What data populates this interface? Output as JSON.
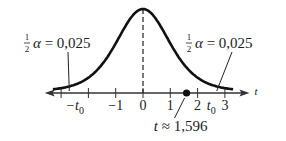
{
  "chart_data": {
    "type": "line",
    "title": "",
    "xlabel": "t",
    "ylabel": "",
    "xlim": [
      -3.6,
      3.9
    ],
    "x_ticks": [
      -3,
      -2,
      -1,
      0,
      1,
      2,
      3
    ],
    "tick_labels": [
      {
        "x": -2.5,
        "text": "−t",
        "sub": "0"
      },
      {
        "x": -1,
        "text": "−1"
      },
      {
        "x": 0,
        "text": "0"
      },
      {
        "x": 1,
        "text": "1"
      },
      {
        "x": 2,
        "text": "2"
      },
      {
        "x": 2.5,
        "text": "t",
        "sub": "0"
      },
      {
        "x": 3,
        "text": "3"
      }
    ],
    "center_line_x": 0,
    "marked_point": {
      "x": 1.596,
      "label": "t ≈ 1,596"
    },
    "annotations": [
      {
        "side": "left",
        "text": "α = 0,025",
        "fraction": "1/2",
        "points_to_x": -2.7
      },
      {
        "side": "right",
        "text": "α = 0,025",
        "fraction": "1/2",
        "points_to_x": 2.7
      }
    ],
    "colors": {
      "curve": "#111111",
      "axis": "#333333"
    }
  }
}
